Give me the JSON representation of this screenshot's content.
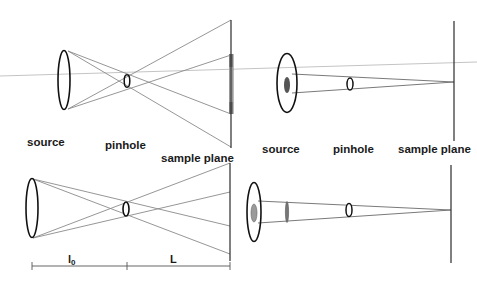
{
  "diagram": {
    "colors": {
      "outline": "#111111",
      "ray": "#8a8a8a",
      "axis": "#c4c4c4",
      "illuminated": "#7a7a7a",
      "illuminated_inner": "#b8b8b8",
      "source_core": "#555555",
      "source_core_light": "#9a9a9a"
    },
    "panels": [
      {
        "id": "top-left",
        "labels": {
          "source": "source",
          "pinhole": "pinhole",
          "sample_plane": "sample plane"
        },
        "description": "Extended source imaged through pinhole; rays cross at pinhole, illuminating an extended region on sample plane"
      },
      {
        "id": "top-right",
        "labels": {
          "source": "source",
          "pinhole": "pinhole",
          "sample_plane": "sample plane"
        },
        "description": "Small source core; rays converge through pinhole to a point on the sample plane"
      },
      {
        "id": "bottom-left",
        "labels": {
          "distance_source_pinhole": "l",
          "distance_source_pinhole_sub": "0",
          "distance_pinhole_sample": "L"
        },
        "description": "Extended source with pinhole, showing distances l0 and L"
      },
      {
        "id": "bottom-right",
        "labels": {},
        "description": "Source with aperture lens, pinhole, and convergence on sample plane"
      }
    ]
  }
}
